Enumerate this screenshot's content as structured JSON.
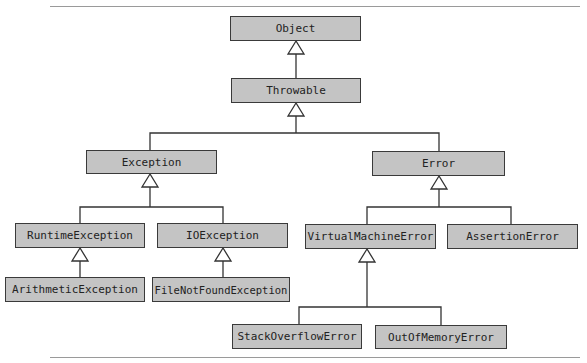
{
  "diagram": {
    "type": "class-hierarchy",
    "nodes": {
      "object": "Object",
      "throwable": "Throwable",
      "exception": "Exception",
      "error": "Error",
      "runtime_exception": "RuntimeException",
      "io_exception": "IOException",
      "virtual_machine_error": "VirtualMachineError",
      "assertion_error": "AssertionError",
      "arithmetic_exception": "ArithmeticException",
      "file_not_found_exception": "FileNotFoundException",
      "stack_overflow_error": "StackOverflowError",
      "out_of_memory_error": "OutOfMemoryError"
    },
    "edges": [
      [
        "Throwable",
        "Object"
      ],
      [
        "Exception",
        "Throwable"
      ],
      [
        "Error",
        "Throwable"
      ],
      [
        "RuntimeException",
        "Exception"
      ],
      [
        "IOException",
        "Exception"
      ],
      [
        "VirtualMachineError",
        "Error"
      ],
      [
        "AssertionError",
        "Error"
      ],
      [
        "ArithmeticException",
        "RuntimeException"
      ],
      [
        "FileNotFoundException",
        "IOException"
      ],
      [
        "StackOverflowError",
        "VirtualMachineError"
      ],
      [
        "OutOfMemoryError",
        "VirtualMachineError"
      ]
    ],
    "colors": {
      "box_fill": "#c4c4c4",
      "box_border": "#3a3a3a",
      "line": "#333333",
      "rule": "#9a9a9a"
    }
  }
}
